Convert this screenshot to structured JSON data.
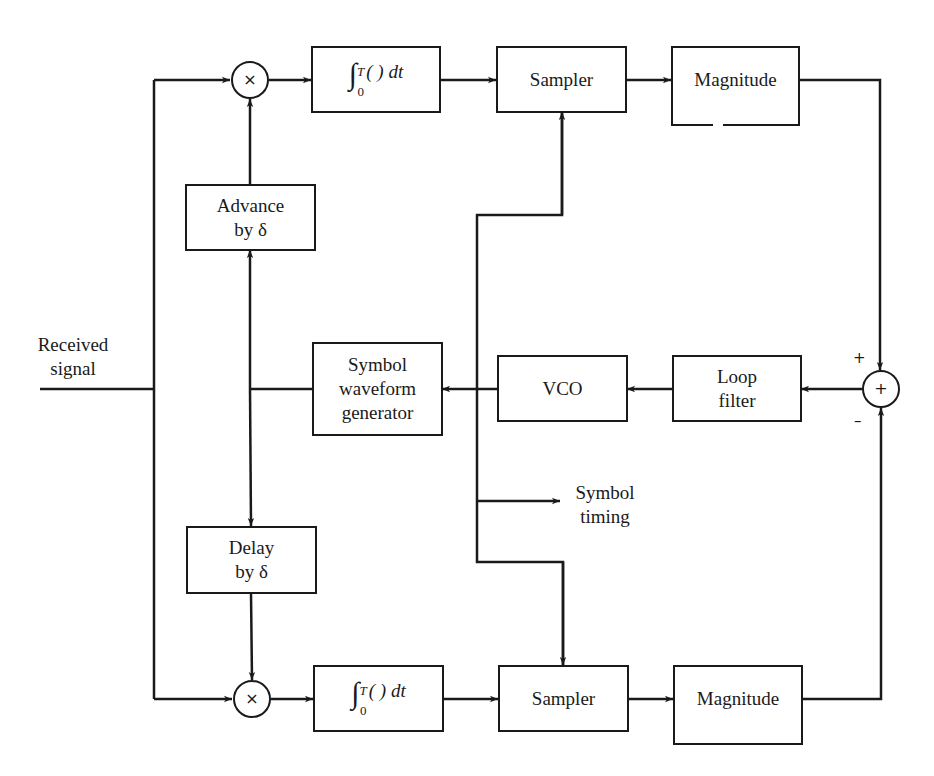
{
  "diagram": {
    "type": "block-diagram",
    "input_label": {
      "line1": "Received",
      "line2": "signal"
    },
    "upper_branch": {
      "multiplier_symbol": "×",
      "integrator": {
        "symbol": "∫",
        "upper_limit": "T",
        "lower_limit": "0",
        "body": "( ) dt"
      },
      "sampler": "Sampler",
      "magnitude": "Magnitude",
      "shift_block": {
        "line1": "Advance",
        "line2": "by δ"
      }
    },
    "lower_branch": {
      "multiplier_symbol": "×",
      "integrator": {
        "symbol": "∫",
        "upper_limit": "T",
        "lower_limit": "0",
        "body": "( ) dt"
      },
      "sampler": "Sampler",
      "magnitude": "Magnitude",
      "shift_block": {
        "line1": "Delay",
        "line2": "by δ"
      }
    },
    "loop": {
      "summer_symbol": "+",
      "summer_plus_sign": "+",
      "summer_minus_sign": "–",
      "loop_filter": {
        "line1": "Loop",
        "line2": "filter"
      },
      "vco": "VCO",
      "waveform_generator": {
        "line1": "Symbol",
        "line2": "waveform",
        "line3": "generator"
      }
    },
    "output_label": {
      "line1": "Symbol",
      "line2": "timing"
    },
    "colors": {
      "line": "#1a1a1a",
      "background": "#ffffff"
    }
  }
}
